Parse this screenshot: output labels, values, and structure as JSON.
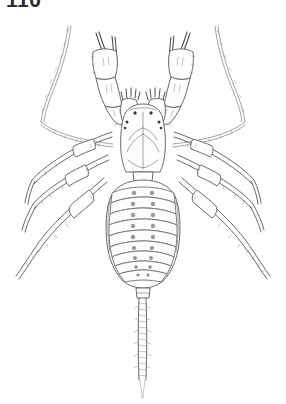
{
  "page": {
    "background_color": "#ffffff",
    "ink_color": "#6a6a6a",
    "dark_ink_color": "#4a4a4a",
    "figure_number": "110",
    "figure_number_clipped": true
  },
  "illustration": {
    "subject_name": "schizomid-arachnid-dorsal-view",
    "view": "dorsal",
    "style": "ink line drawing",
    "parts": [
      {
        "name": "carapace",
        "label": ""
      },
      {
        "name": "eye-spots",
        "label": ""
      },
      {
        "name": "chelicerae",
        "label": ""
      },
      {
        "name": "pedipalp-left",
        "label": ""
      },
      {
        "name": "pedipalp-right",
        "label": ""
      },
      {
        "name": "antenniform-leg-left",
        "label": ""
      },
      {
        "name": "antenniform-leg-right",
        "label": ""
      },
      {
        "name": "walking-leg-left-2",
        "label": ""
      },
      {
        "name": "walking-leg-left-3",
        "label": ""
      },
      {
        "name": "walking-leg-left-4",
        "label": ""
      },
      {
        "name": "walking-leg-right-2",
        "label": ""
      },
      {
        "name": "walking-leg-right-3",
        "label": ""
      },
      {
        "name": "walking-leg-right-4",
        "label": ""
      },
      {
        "name": "opisthosoma",
        "label": ""
      },
      {
        "name": "flagellum",
        "label": ""
      }
    ],
    "abdomen": {
      "segment_count": 9,
      "dot_pairs_per_segment": 2
    }
  }
}
